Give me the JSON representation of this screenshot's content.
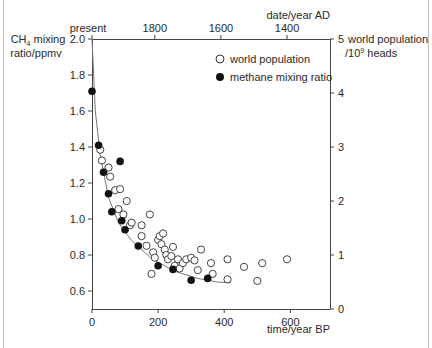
{
  "chart_data": {
    "type": "scatter",
    "title": "",
    "xlabel": "time/year BP",
    "x_top_label": "date/year AD",
    "ylabel_left": "CH4 mixing ratio/ppmv",
    "ylabel_right": "world population /10^9 heads",
    "xlim": [
      0,
      720
    ],
    "ylim_left": [
      0.5,
      2.0
    ],
    "ylim_right": [
      0,
      5
    ],
    "x_ticks": [
      0,
      200,
      400,
      600
    ],
    "x_top_ticks": [
      "present",
      "1800",
      "1600",
      "1400"
    ],
    "y_left_ticks": [
      0.6,
      0.8,
      1.0,
      1.2,
      1.4,
      1.6,
      1.8,
      2.0
    ],
    "y_right_ticks": [
      0,
      1,
      2,
      3,
      4,
      5
    ],
    "grid": false,
    "legend_position": "upper right",
    "series": [
      {
        "name": "world population",
        "marker": "open-circle",
        "axis": "right",
        "points": [
          [
            25,
            2.95
          ],
          [
            30,
            2.75
          ],
          [
            50,
            2.62
          ],
          [
            55,
            2.45
          ],
          [
            70,
            2.2
          ],
          [
            80,
            1.85
          ],
          [
            85,
            2.22
          ],
          [
            95,
            1.75
          ],
          [
            105,
            2.0
          ],
          [
            115,
            1.55
          ],
          [
            120,
            1.6
          ],
          [
            150,
            1.55
          ],
          [
            150,
            1.35
          ],
          [
            165,
            1.17
          ],
          [
            175,
            1.75
          ],
          [
            180,
            0.65
          ],
          [
            185,
            1.05
          ],
          [
            190,
            0.95
          ],
          [
            200,
            1.28
          ],
          [
            205,
            1.35
          ],
          [
            210,
            1.2
          ],
          [
            215,
            1.4
          ],
          [
            220,
            1.1
          ],
          [
            225,
            1.0
          ],
          [
            230,
            0.92
          ],
          [
            240,
            0.98
          ],
          [
            245,
            1.15
          ],
          [
            250,
            0.8
          ],
          [
            260,
            0.92
          ],
          [
            265,
            0.75
          ],
          [
            275,
            0.85
          ],
          [
            285,
            0.92
          ],
          [
            300,
            0.95
          ],
          [
            310,
            0.9
          ],
          [
            320,
            0.72
          ],
          [
            330,
            1.1
          ],
          [
            360,
            0.85
          ],
          [
            365,
            0.65
          ],
          [
            410,
            0.55
          ],
          [
            410,
            0.92
          ],
          [
            460,
            0.78
          ],
          [
            500,
            0.52
          ],
          [
            515,
            0.85
          ],
          [
            590,
            0.92
          ]
        ]
      },
      {
        "name": "methane mixing ratio",
        "marker": "filled-circle",
        "axis": "left",
        "points": [
          [
            0,
            1.71
          ],
          [
            20,
            1.41
          ],
          [
            35,
            1.26
          ],
          [
            50,
            1.14
          ],
          [
            60,
            1.04
          ],
          [
            85,
            1.32
          ],
          [
            90,
            0.99
          ],
          [
            100,
            0.94
          ],
          [
            140,
            0.85
          ],
          [
            200,
            0.74
          ],
          [
            245,
            0.72
          ],
          [
            300,
            0.66
          ],
          [
            350,
            0.67
          ]
        ]
      }
    ],
    "fit_curve": {
      "description": "exponential-like decay fit through both series",
      "points": [
        [
          0,
          2.0
        ],
        [
          10,
          1.6
        ],
        [
          25,
          1.35
        ],
        [
          50,
          1.12
        ],
        [
          80,
          0.98
        ],
        [
          120,
          0.88
        ],
        [
          180,
          0.78
        ],
        [
          250,
          0.71
        ],
        [
          320,
          0.67
        ],
        [
          380,
          0.65
        ],
        [
          420,
          0.645
        ]
      ]
    }
  },
  "labels": {
    "left_axis_line1": "CH",
    "left_axis_sub": "4",
    "left_axis_line1_rest": " mixing",
    "left_axis_line2": "ratio/ppmv",
    "right_axis_line1": "world population",
    "right_axis_line2_pre": "/10",
    "right_axis_sup": "9",
    "right_axis_line2_post": " heads",
    "top_axis_title": "date/year AD",
    "bottom_axis_title": "time/year BP",
    "legend_open": "world population",
    "legend_filled": "methane mixing ratio",
    "top_ticks": [
      "present",
      "1800",
      "1600",
      "1400"
    ],
    "bottom_ticks": [
      "0",
      "200",
      "400",
      "600"
    ],
    "left_ticks": [
      "2.0",
      "1.8",
      "1.6",
      "1.4",
      "1.2",
      "1.0",
      "0.8",
      "0.6"
    ],
    "right_ticks": [
      "5",
      "4",
      "3",
      "2",
      "1",
      "0"
    ]
  }
}
